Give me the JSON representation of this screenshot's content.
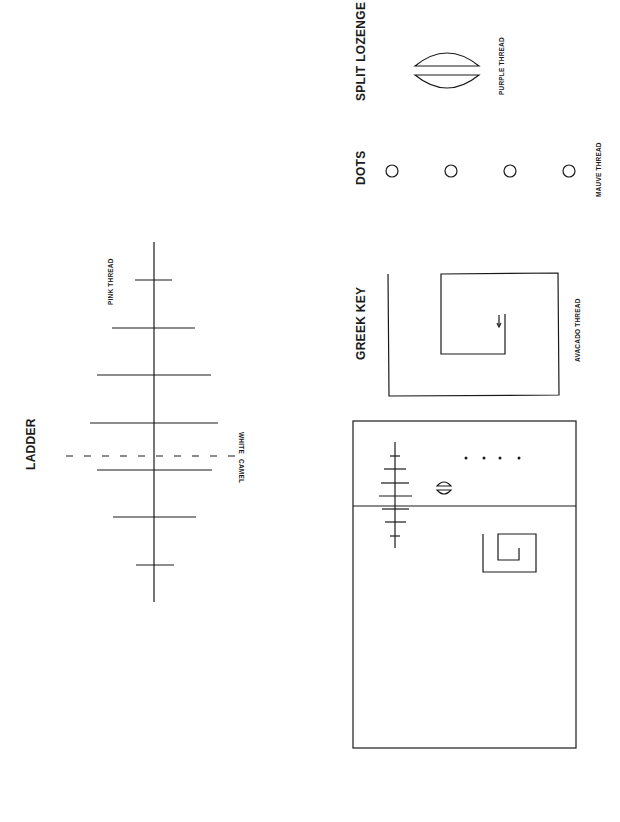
{
  "ladder": {
    "title": "LADDER",
    "thread_label": "PINK THREAD",
    "white_label": "WHITE",
    "camel_label": "CAMEL",
    "rungs": [
      {
        "y": 280,
        "x1": 135,
        "x2": 172
      },
      {
        "y": 328,
        "x1": 112,
        "x2": 195
      },
      {
        "y": 375,
        "x1": 97,
        "x2": 211
      },
      {
        "y": 423,
        "x1": 90,
        "x2": 218
      },
      {
        "y": 470,
        "x1": 97,
        "x2": 212
      },
      {
        "y": 517,
        "x1": 113,
        "x2": 196
      },
      {
        "y": 565,
        "x1": 136,
        "x2": 174
      }
    ]
  },
  "split_lozenge": {
    "title": "SPLIT LOZENGE",
    "thread_label": "PURPLE THREAD"
  },
  "dots": {
    "title": "DOTS",
    "thread_label": "MAUVE THREAD",
    "count": 4
  },
  "greek_key": {
    "title": "GREEK KEY",
    "thread_label": "AVACADO THREAD"
  },
  "colors": {
    "ink": "#1a1a1a",
    "background": "#ffffff"
  }
}
